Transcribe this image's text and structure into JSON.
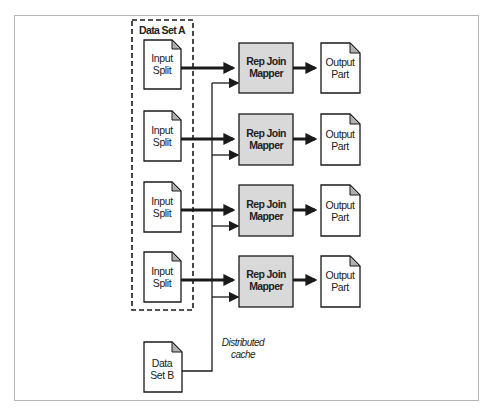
{
  "diagram": {
    "dataset_a": {
      "title": "Data Set A"
    },
    "input_splits": [
      {
        "line1": "Input",
        "line2": "Split"
      },
      {
        "line1": "Input",
        "line2": "Split"
      },
      {
        "line1": "Input",
        "line2": "Split"
      },
      {
        "line1": "Input",
        "line2": "Split"
      }
    ],
    "mappers": [
      {
        "line1": "Rep Join",
        "line2": "Mapper"
      },
      {
        "line1": "Rep Join",
        "line2": "Mapper"
      },
      {
        "line1": "Rep Join",
        "line2": "Mapper"
      },
      {
        "line1": "Rep Join",
        "line2": "Mapper"
      }
    ],
    "outputs": [
      {
        "line1": "Output",
        "line2": "Part"
      },
      {
        "line1": "Output",
        "line2": "Part"
      },
      {
        "line1": "Output",
        "line2": "Part"
      },
      {
        "line1": "Output",
        "line2": "Part"
      }
    ],
    "dataset_b": {
      "line1": "Data",
      "line2": "Set B"
    },
    "cache_label": {
      "line1": "Distributed",
      "line2": "cache"
    },
    "colors": {
      "mapper_fill": "#d9d9d9",
      "stroke": "#1a1a1a",
      "doc_corner": "#b0b0b0",
      "frame": "#b5b5b5"
    }
  }
}
